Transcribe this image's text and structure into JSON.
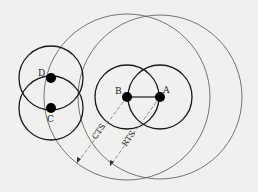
{
  "diagram": {
    "type": "wireless-range-diagram",
    "colors": {
      "background": "#f0f0ef",
      "node_circle": "#1a1a1a",
      "range_circle": "#555555",
      "node": "#000000",
      "dashed_line": "#777777"
    },
    "nodes": [
      {
        "id": "A",
        "label": "A",
        "x": 160,
        "y": 97
      },
      {
        "id": "B",
        "label": "B",
        "x": 127,
        "y": 97
      },
      {
        "id": "C",
        "label": "C",
        "x": 51,
        "y": 108
      },
      {
        "id": "D",
        "label": "D",
        "x": 51,
        "y": 78
      }
    ],
    "node_range_radius": 32,
    "large_ranges": [
      {
        "center": "B",
        "radius": 83
      },
      {
        "center": "A",
        "radius": 82
      }
    ],
    "link": {
      "from": "B",
      "to": "A"
    },
    "annotations": [
      {
        "label": "CTS",
        "from": "B",
        "to": [
          77,
          163
        ]
      },
      {
        "label": "RTS",
        "from": "A",
        "to": [
          110,
          166
        ]
      }
    ]
  }
}
